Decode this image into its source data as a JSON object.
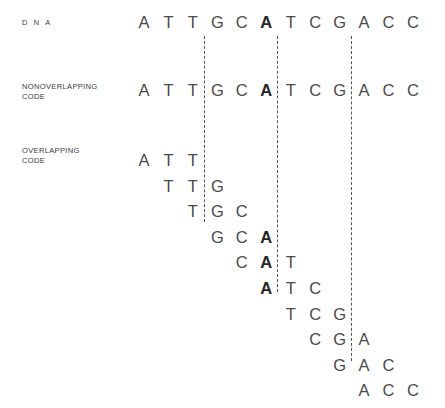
{
  "figure": {
    "sequence": "ATTGCATCGACC",
    "highlight_base": "A",
    "highlight_index": 5
  },
  "labels": {
    "dna": "D N A",
    "nonoverlapping": "NONOVERLAPPING\nCODE",
    "overlapping": "OVERLAPPING\nCODE"
  },
  "chart_data": {
    "type": "table",
    "sequence": [
      "A",
      "T",
      "T",
      "G",
      "C",
      "A",
      "T",
      "C",
      "G",
      "A",
      "C",
      "C"
    ],
    "highlight_columns": [
      5
    ],
    "codon_boundaries_after_column": [
      2,
      5,
      8
    ],
    "rows": [
      {
        "name": "dna",
        "label": "D N A",
        "start_column": 0,
        "bases": [
          "A",
          "T",
          "T",
          "G",
          "C",
          "A",
          "T",
          "C",
          "G",
          "A",
          "C",
          "C"
        ],
        "bold": [
          false,
          false,
          false,
          false,
          false,
          true,
          false,
          false,
          false,
          false,
          false,
          false
        ]
      },
      {
        "name": "nonoverlapping-code",
        "label": "NONOVERLAPPING CODE",
        "start_column": 0,
        "bases": [
          "A",
          "T",
          "T",
          "G",
          "C",
          "A",
          "T",
          "C",
          "G",
          "A",
          "C",
          "C"
        ],
        "bold": [
          false,
          false,
          false,
          false,
          false,
          true,
          false,
          false,
          false,
          false,
          false,
          false
        ]
      },
      {
        "name": "overlapping-triplet-1",
        "start_column": 0,
        "bases": [
          "A",
          "T",
          "T"
        ],
        "bold": [
          false,
          false,
          false
        ]
      },
      {
        "name": "overlapping-triplet-2",
        "start_column": 1,
        "bases": [
          "T",
          "T",
          "G"
        ],
        "bold": [
          false,
          false,
          false
        ]
      },
      {
        "name": "overlapping-triplet-3",
        "start_column": 2,
        "bases": [
          "T",
          "G",
          "C"
        ],
        "bold": [
          false,
          false,
          false
        ]
      },
      {
        "name": "overlapping-triplet-4",
        "start_column": 3,
        "bases": [
          "G",
          "C",
          "A"
        ],
        "bold": [
          false,
          false,
          true
        ]
      },
      {
        "name": "overlapping-triplet-5",
        "start_column": 4,
        "bases": [
          "C",
          "A",
          "T"
        ],
        "bold": [
          false,
          true,
          false
        ]
      },
      {
        "name": "overlapping-triplet-6",
        "start_column": 5,
        "bases": [
          "A",
          "T",
          "C"
        ],
        "bold": [
          true,
          false,
          false
        ]
      },
      {
        "name": "overlapping-triplet-7",
        "start_column": 6,
        "bases": [
          "T",
          "C",
          "G"
        ],
        "bold": [
          false,
          false,
          false
        ]
      },
      {
        "name": "overlapping-triplet-8",
        "start_column": 7,
        "bases": [
          "C",
          "G",
          "A"
        ],
        "bold": [
          false,
          false,
          false
        ]
      },
      {
        "name": "overlapping-triplet-9",
        "start_column": 8,
        "bases": [
          "G",
          "A",
          "C"
        ],
        "bold": [
          false,
          false,
          false
        ]
      },
      {
        "name": "overlapping-triplet-10",
        "start_column": 9,
        "bases": [
          "A",
          "C",
          "C"
        ],
        "bold": [
          false,
          false,
          false
        ]
      }
    ]
  },
  "layout": {
    "column_origin_x": 133,
    "column_step_x": 24.45,
    "dna_row_y": 12,
    "nonoverlapping_row_y": 80,
    "overlapping_first_row_y": 150,
    "overlapping_row_step_y": 25.6,
    "dividers": [
      {
        "name": "codon-divider-1",
        "x": 204,
        "y": 36,
        "height": 186
      },
      {
        "name": "codon-divider-2",
        "x": 277,
        "y": 36,
        "height": 256
      },
      {
        "name": "codon-divider-3",
        "x": 351,
        "y": 36,
        "height": 325
      }
    ]
  },
  "colors": {
    "background": "#ffffff",
    "base_text": "#4a4a4a",
    "highlight_text": "#262626",
    "label_text": "#3b3b3b",
    "divider": "#555555"
  }
}
